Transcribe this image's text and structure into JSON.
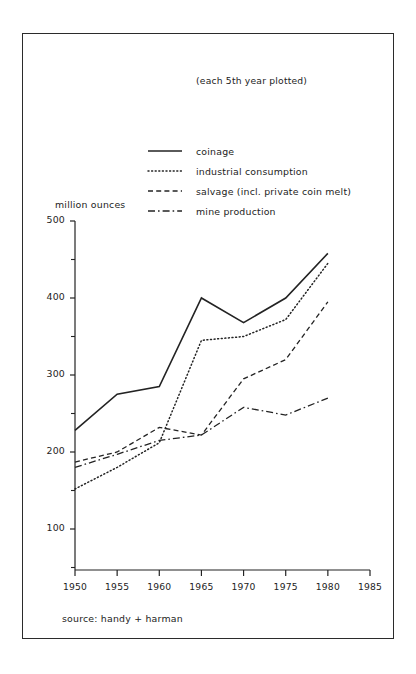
{
  "figure": {
    "subtitle": "(each 5th year plotted)",
    "source_note": "source: handy + harman",
    "y_axis_title": "million ounces",
    "ink_color": "#232323"
  },
  "legend": {
    "entries": [
      {
        "label": "coinage",
        "style": "solid",
        "key": "coinage"
      },
      {
        "label": "industrial consumption",
        "style": "dotted",
        "key": "industrial_consumption"
      },
      {
        "label": "salvage (incl. private coin melt)",
        "style": "dashed",
        "key": "salvage"
      },
      {
        "label": "mine production",
        "style": "dashdot",
        "key": "mine_production"
      }
    ]
  },
  "axes": {
    "y_major_ticks": [
      "500",
      "400",
      "300",
      "200",
      "100"
    ],
    "y_major_values": [
      500,
      400,
      300,
      200,
      100
    ],
    "y_minor_values": [
      450,
      350,
      250,
      150,
      50
    ],
    "x_ticks": [
      "1950",
      "1955",
      "1960",
      "1965",
      "1970",
      "1975",
      "1980",
      "1985"
    ]
  },
  "chart_data": {
    "type": "line",
    "title": "",
    "subtitle": "(each 5th year plotted)",
    "xlabel": "",
    "ylabel": "million ounces",
    "xlim": [
      1950,
      1985
    ],
    "ylim": [
      0,
      500
    ],
    "grid": false,
    "legend_position": "upper-center",
    "annotations": [
      "(each 5th year plotted)",
      "source: handy + harman"
    ],
    "x": [
      1950,
      1955,
      1960,
      1965,
      1970,
      1975,
      1980
    ],
    "series": [
      {
        "name": "coinage",
        "style": "solid",
        "values": [
          228,
          275,
          285,
          400,
          368,
          400,
          458
        ]
      },
      {
        "name": "industrial consumption",
        "style": "dotted",
        "values": [
          152,
          180,
          212,
          345,
          350,
          372,
          445
        ]
      },
      {
        "name": "salvage (incl. private coin melt)",
        "style": "dashed",
        "values": [
          187,
          200,
          232,
          222,
          295,
          320,
          395
        ]
      },
      {
        "name": "mine production",
        "style": "dashdot",
        "values": [
          180,
          197,
          215,
          222,
          258,
          248,
          270
        ]
      }
    ]
  }
}
